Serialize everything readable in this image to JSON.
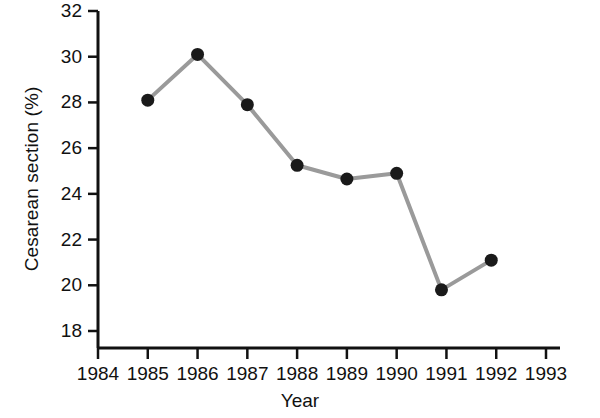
{
  "chart_data": {
    "type": "line",
    "title": "",
    "xlabel": "Year",
    "ylabel": "Cesarean section (%)",
    "x": [
      1985,
      1986,
      1987,
      1988,
      1989,
      1990,
      1990.9,
      1991.9
    ],
    "values": [
      28.1,
      30.1,
      27.9,
      25.25,
      24.65,
      24.9,
      19.8,
      21.1
    ],
    "xlim": [
      1984,
      1993
    ],
    "ylim": [
      18,
      32
    ],
    "xticks": [
      1984,
      1985,
      1986,
      1987,
      1988,
      1989,
      1990,
      1991,
      1992,
      1993
    ],
    "xtick_labels": [
      "1984",
      "1985",
      "1986",
      "1987",
      "1988",
      "1989",
      "1990",
      "1991",
      "1992",
      "1993"
    ],
    "yticks": [
      18,
      20,
      22,
      24,
      26,
      28,
      30,
      32
    ],
    "ytick_labels": [
      "18",
      "20",
      "22",
      "24",
      "26",
      "28",
      "30",
      "32"
    ],
    "grid": false,
    "legend": false,
    "series": [
      {
        "name": "Cesarean section rate",
        "marker": "filled-circle",
        "marker_color": "#1a1a1a",
        "line_color": "#9a9a9a",
        "values": [
          28.1,
          30.1,
          27.9,
          25.25,
          24.65,
          24.9,
          19.8,
          21.1
        ]
      }
    ]
  },
  "axis": {
    "y_title": "Cesarean section (%)",
    "x_title": "Year"
  },
  "colors": {
    "axis": "#111111",
    "line": "#9a9a9a",
    "marker": "#1a1a1a",
    "background": "#ffffff"
  }
}
